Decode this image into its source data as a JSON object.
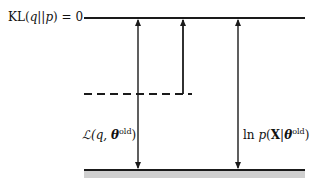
{
  "diagram": {
    "top_line": {
      "label": "KL(q||p) = 0",
      "label_parts": {
        "fn": "KL",
        "args": "(q||p)",
        "eq": " = 0"
      }
    },
    "lower_bound_label": {
      "prefix": "ℒ(q, ",
      "theta": "θ",
      "sup": "old",
      "suffix": ")"
    },
    "log_likelihood_label": {
      "prefix": "ln p(",
      "X": "X",
      "bar": "|",
      "theta": "θ",
      "sup": "old",
      "suffix": ")"
    },
    "colors": {
      "line": "#1a1a1a",
      "baseline_fill": "#cfcfcf",
      "dashed": "#1a1a1a"
    },
    "geometry": {
      "top_y": 18,
      "dashed_y": 94,
      "bottom_y": 170,
      "line_x_start": 84,
      "line_x_end": 305,
      "dashed_x_end": 192,
      "arrow_lower_bound_x": 138,
      "arrow_gap_x": 183,
      "arrow_loglik_x": 238
    }
  }
}
